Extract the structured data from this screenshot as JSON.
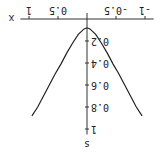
{
  "chart_data": {
    "type": "line",
    "title": "",
    "xlabel": "x",
    "ylabel": "s",
    "xlim": [
      -1.1,
      1.1
    ],
    "ylim": [
      0,
      1.05
    ],
    "x_ticks": [
      -1,
      -0.5,
      0.5,
      1
    ],
    "x_tick_labels": [
      "-1",
      "-0.5",
      "0.5",
      "1"
    ],
    "y_ticks": [
      0.2,
      0.4,
      0.6,
      0.8,
      1
    ],
    "y_tick_labels": [
      "0.2",
      "0.4",
      "0.6",
      "0.8",
      "1"
    ],
    "grid": false,
    "rotation_deg": 180,
    "series": [
      {
        "name": "s(x)",
        "color": "#222222",
        "x": [
          -0.95,
          -0.85,
          -0.75,
          -0.65,
          -0.55,
          -0.45,
          -0.35,
          -0.25,
          -0.15,
          -0.05,
          0,
          0.05,
          0.15,
          0.25,
          0.35,
          0.45,
          0.55,
          0.65,
          0.75,
          0.85,
          0.95
        ],
        "y": [
          0.88,
          0.8,
          0.7,
          0.6,
          0.5,
          0.41,
          0.31,
          0.22,
          0.14,
          0.09,
          0.08,
          0.09,
          0.14,
          0.22,
          0.31,
          0.41,
          0.5,
          0.6,
          0.7,
          0.8,
          0.88
        ]
      }
    ]
  }
}
